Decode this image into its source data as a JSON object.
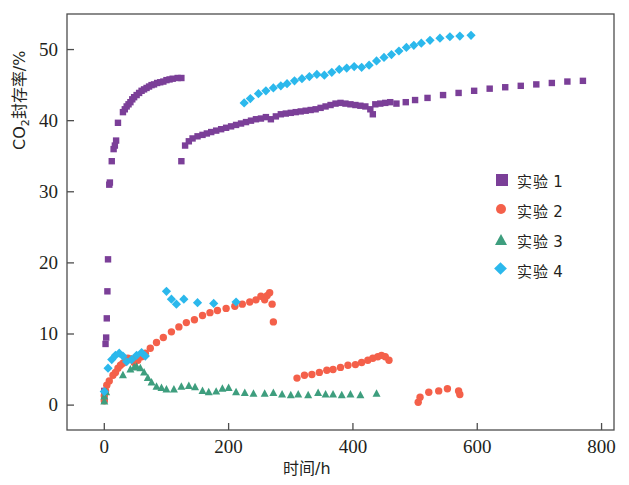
{
  "chart_data": {
    "type": "scatter",
    "title": "",
    "xlabel": "时间/h",
    "ylabel": "CO2封存率/%",
    "ylabel_prefix": "CO",
    "ylabel_sub": "2",
    "ylabel_suffix": "封存率/%",
    "xlim": [
      -60,
      820
    ],
    "ylim": [
      -3.5,
      55
    ],
    "xticks": [
      0,
      200,
      400,
      600,
      800
    ],
    "yticks": [
      0,
      10,
      20,
      30,
      40,
      50
    ],
    "grid": false,
    "legend_position": "right-middle",
    "colors": {
      "series1": "#7b3f98",
      "series2": "#f4604a",
      "series3": "#3e9e7e",
      "series4": "#2bb8ec",
      "axis": "#4d4d4d",
      "text": "#231f20"
    },
    "series": [
      {
        "name": "实验 1",
        "marker": "square",
        "color": "#7b3f98",
        "points": [
          [
            0,
            0.8
          ],
          [
            0,
            2.0
          ],
          [
            2,
            8.6
          ],
          [
            3,
            9.5
          ],
          [
            4,
            12.2
          ],
          [
            5,
            16.0
          ],
          [
            6,
            20.5
          ],
          [
            8,
            31.0
          ],
          [
            9,
            31.3
          ],
          [
            12,
            34.3
          ],
          [
            15,
            36.0
          ],
          [
            17,
            36.5
          ],
          [
            19,
            37.2
          ],
          [
            22,
            39.7
          ],
          [
            30,
            41.2
          ],
          [
            33,
            41.6
          ],
          [
            36,
            42.0
          ],
          [
            39,
            42.3
          ],
          [
            42,
            42.6
          ],
          [
            45,
            43.0
          ],
          [
            48,
            43.3
          ],
          [
            52,
            43.6
          ],
          [
            56,
            43.9
          ],
          [
            60,
            44.2
          ],
          [
            64,
            44.4
          ],
          [
            68,
            44.6
          ],
          [
            72,
            44.8
          ],
          [
            76,
            45.0
          ],
          [
            80,
            45.1
          ],
          [
            85,
            45.3
          ],
          [
            90,
            45.4
          ],
          [
            95,
            45.5
          ],
          [
            100,
            45.7
          ],
          [
            105,
            45.8
          ],
          [
            110,
            45.9
          ],
          [
            118,
            46.0
          ],
          [
            124,
            46.0
          ],
          [
            124,
            34.3
          ],
          [
            130,
            36.5
          ],
          [
            136,
            37.1
          ],
          [
            142,
            37.5
          ],
          [
            150,
            37.8
          ],
          [
            158,
            38.0
          ],
          [
            165,
            38.2
          ],
          [
            172,
            38.4
          ],
          [
            180,
            38.6
          ],
          [
            188,
            38.8
          ],
          [
            196,
            39.0
          ],
          [
            204,
            39.2
          ],
          [
            212,
            39.4
          ],
          [
            220,
            39.6
          ],
          [
            228,
            39.8
          ],
          [
            236,
            40.0
          ],
          [
            244,
            40.2
          ],
          [
            252,
            40.3
          ],
          [
            260,
            40.5
          ],
          [
            268,
            40.2
          ],
          [
            276,
            40.6
          ],
          [
            284,
            40.9
          ],
          [
            292,
            41.0
          ],
          [
            300,
            41.1
          ],
          [
            308,
            41.2
          ],
          [
            316,
            41.3
          ],
          [
            324,
            41.4
          ],
          [
            332,
            41.5
          ],
          [
            340,
            41.6
          ],
          [
            348,
            41.8
          ],
          [
            356,
            42.0
          ],
          [
            364,
            42.2
          ],
          [
            372,
            42.4
          ],
          [
            380,
            42.5
          ],
          [
            388,
            42.4
          ],
          [
            396,
            42.3
          ],
          [
            404,
            42.2
          ],
          [
            412,
            42.1
          ],
          [
            420,
            42.0
          ],
          [
            428,
            41.6
          ],
          [
            432,
            40.9
          ],
          [
            436,
            42.3
          ],
          [
            444,
            42.4
          ],
          [
            452,
            42.5
          ],
          [
            460,
            42.6
          ],
          [
            470,
            42.4
          ],
          [
            485,
            42.6
          ],
          [
            500,
            42.9
          ],
          [
            520,
            43.2
          ],
          [
            545,
            43.6
          ],
          [
            570,
            43.9
          ],
          [
            595,
            44.2
          ],
          [
            620,
            44.5
          ],
          [
            645,
            44.7
          ],
          [
            670,
            44.9
          ],
          [
            695,
            45.1
          ],
          [
            720,
            45.3
          ],
          [
            745,
            45.5
          ],
          [
            770,
            45.6
          ]
        ]
      },
      {
        "name": "实验 2",
        "marker": "circle",
        "color": "#f4604a",
        "points": [
          [
            0,
            0.6
          ],
          [
            0,
            1.3
          ],
          [
            2,
            2.0
          ],
          [
            4,
            2.8
          ],
          [
            8,
            3.4
          ],
          [
            14,
            4.2
          ],
          [
            18,
            4.6
          ],
          [
            22,
            5.2
          ],
          [
            26,
            5.6
          ],
          [
            30,
            5.9
          ],
          [
            34,
            6.3
          ],
          [
            38,
            6.6
          ],
          [
            44,
            6.5
          ],
          [
            48,
            6.0
          ],
          [
            54,
            6.3
          ],
          [
            60,
            6.8
          ],
          [
            66,
            7.3
          ],
          [
            74,
            8.0
          ],
          [
            84,
            8.8
          ],
          [
            95,
            9.5
          ],
          [
            108,
            10.3
          ],
          [
            120,
            11.0
          ],
          [
            132,
            11.6
          ],
          [
            145,
            12.0
          ],
          [
            158,
            12.6
          ],
          [
            170,
            13.0
          ],
          [
            182,
            13.3
          ],
          [
            196,
            13.6
          ],
          [
            210,
            13.9
          ],
          [
            222,
            14.2
          ],
          [
            234,
            14.5
          ],
          [
            244,
            14.8
          ],
          [
            252,
            15.3
          ],
          [
            258,
            14.8
          ],
          [
            262,
            15.4
          ],
          [
            266,
            15.8
          ],
          [
            270,
            14.2
          ],
          [
            272,
            11.7
          ],
          [
            310,
            3.8
          ],
          [
            322,
            4.2
          ],
          [
            334,
            4.3
          ],
          [
            346,
            4.6
          ],
          [
            358,
            4.9
          ],
          [
            368,
            5.0
          ],
          [
            380,
            5.3
          ],
          [
            392,
            5.6
          ],
          [
            404,
            5.7
          ],
          [
            414,
            6.0
          ],
          [
            424,
            6.3
          ],
          [
            432,
            6.6
          ],
          [
            440,
            6.8
          ],
          [
            446,
            7.0
          ],
          [
            452,
            6.8
          ],
          [
            458,
            6.3
          ],
          [
            505,
            0.4
          ],
          [
            508,
            1.1
          ],
          [
            522,
            1.8
          ],
          [
            538,
            2.0
          ],
          [
            552,
            2.3
          ],
          [
            570,
            2.0
          ],
          [
            572,
            1.5
          ]
        ]
      },
      {
        "name": "实验 3",
        "marker": "triangle",
        "color": "#3e9e7e",
        "points": [
          [
            0,
            0.5
          ],
          [
            0,
            1.2
          ],
          [
            3,
            1.8
          ],
          [
            30,
            4.2
          ],
          [
            42,
            5.0
          ],
          [
            48,
            5.3
          ],
          [
            52,
            5.4
          ],
          [
            58,
            5.2
          ],
          [
            64,
            4.6
          ],
          [
            70,
            3.8
          ],
          [
            76,
            3.2
          ],
          [
            84,
            2.6
          ],
          [
            92,
            2.4
          ],
          [
            100,
            2.2
          ],
          [
            112,
            2.2
          ],
          [
            124,
            2.6
          ],
          [
            136,
            2.7
          ],
          [
            146,
            2.5
          ],
          [
            158,
            2.0
          ],
          [
            168,
            1.8
          ],
          [
            180,
            1.9
          ],
          [
            190,
            2.3
          ],
          [
            200,
            2.4
          ],
          [
            212,
            1.8
          ],
          [
            226,
            1.7
          ],
          [
            240,
            1.6
          ],
          [
            258,
            1.6
          ],
          [
            272,
            1.7
          ],
          [
            286,
            1.5
          ],
          [
            300,
            1.4
          ],
          [
            312,
            1.5
          ],
          [
            328,
            1.4
          ],
          [
            344,
            1.7
          ],
          [
            356,
            1.5
          ],
          [
            368,
            1.5
          ],
          [
            382,
            1.4
          ],
          [
            396,
            1.5
          ],
          [
            412,
            1.4
          ],
          [
            438,
            1.6
          ]
        ]
      },
      {
        "name": "实验 4",
        "marker": "diamond",
        "color": "#2bb8ec",
        "points": [
          [
            0,
            1.9
          ],
          [
            6,
            5.2
          ],
          [
            12,
            6.4
          ],
          [
            18,
            7.0
          ],
          [
            24,
            7.3
          ],
          [
            30,
            6.9
          ],
          [
            36,
            6.1
          ],
          [
            44,
            6.4
          ],
          [
            52,
            7.0
          ],
          [
            60,
            7.4
          ],
          [
            66,
            6.9
          ],
          [
            100,
            16.0
          ],
          [
            108,
            14.9
          ],
          [
            116,
            14.2
          ],
          [
            128,
            14.9
          ],
          [
            150,
            14.4
          ],
          [
            176,
            14.3
          ],
          [
            212,
            14.5
          ],
          [
            225,
            42.5
          ],
          [
            235,
            43.1
          ],
          [
            248,
            43.8
          ],
          [
            260,
            44.2
          ],
          [
            272,
            44.6
          ],
          [
            284,
            44.9
          ],
          [
            294,
            45.2
          ],
          [
            306,
            45.6
          ],
          [
            318,
            45.9
          ],
          [
            330,
            46.2
          ],
          [
            342,
            46.5
          ],
          [
            354,
            46.4
          ],
          [
            366,
            46.8
          ],
          [
            378,
            47.2
          ],
          [
            390,
            47.4
          ],
          [
            402,
            47.6
          ],
          [
            414,
            47.5
          ],
          [
            426,
            47.8
          ],
          [
            438,
            48.4
          ],
          [
            450,
            48.9
          ],
          [
            462,
            49.3
          ],
          [
            474,
            49.8
          ],
          [
            486,
            50.3
          ],
          [
            498,
            50.6
          ],
          [
            510,
            50.9
          ],
          [
            524,
            51.3
          ],
          [
            540,
            51.6
          ],
          [
            556,
            51.8
          ],
          [
            572,
            51.9
          ],
          [
            590,
            52.0
          ]
        ]
      }
    ]
  },
  "axis": {
    "x_ticklabels": [
      "0",
      "200",
      "400",
      "600",
      "800"
    ],
    "y_ticklabels": [
      "0",
      "10",
      "20",
      "30",
      "40",
      "50"
    ],
    "x_title": "时间/h",
    "y_title_main": "CO",
    "y_title_sub": "2",
    "y_title_rest": "封存率/%"
  },
  "legend": {
    "items": [
      {
        "label": "实验 1",
        "marker": "square-marker",
        "color": "#7b3f98"
      },
      {
        "label": "实验 2",
        "marker": "circle-marker",
        "color": "#f4604a"
      },
      {
        "label": "实验 3",
        "marker": "triangle-marker",
        "color": "#3e9e7e"
      },
      {
        "label": "实验 4",
        "marker": "diamond-marker",
        "color": "#2bb8ec"
      }
    ]
  }
}
